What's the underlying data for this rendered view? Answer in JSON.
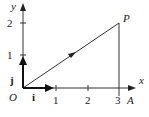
{
  "diagram": {
    "axes": {
      "x_label": "x",
      "y_label": "y",
      "origin_label": "O"
    },
    "x_ticks": [
      "1",
      "2",
      "3"
    ],
    "y_ticks": [
      "1",
      "2"
    ],
    "points": {
      "P": "P",
      "A": "A"
    },
    "unit_vectors": {
      "i": "i",
      "j": "j"
    },
    "segment": {
      "from": [
        0,
        0
      ],
      "to": [
        3,
        2
      ]
    },
    "vertical_line": {
      "from": [
        3,
        0
      ],
      "to": [
        3,
        2
      ]
    }
  }
}
